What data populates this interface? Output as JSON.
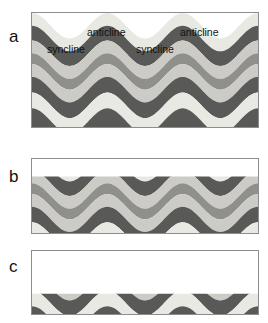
{
  "figure": {
    "caption_present": false,
    "background": "#ffffff",
    "width": 268,
    "height": 323
  },
  "panels": [
    {
      "id": "a",
      "label": "a",
      "label_x": 9,
      "label_y": 28,
      "x": 31,
      "y": 12,
      "w": 228,
      "h": 116,
      "description": "uneroded folded strata",
      "erosion_level": 0
    },
    {
      "id": "b",
      "label": "b",
      "label_x": 9,
      "label_y": 168,
      "x": 31,
      "y": 158,
      "w": 228,
      "h": 76,
      "description": "partially eroded folded strata",
      "erosion_level": 1
    },
    {
      "id": "c",
      "label": "c",
      "label_x": 9,
      "label_y": 258,
      "x": 31,
      "y": 250,
      "w": 228,
      "h": 65,
      "description": "deeply eroded folded strata exposing anticline cores",
      "erosion_level": 2
    }
  ],
  "annotations": [
    {
      "text": "syncline",
      "x": 47,
      "y": 44,
      "panel": "a"
    },
    {
      "text": "anticline",
      "x": 87,
      "y": 27,
      "panel": "a"
    },
    {
      "text": "syncline",
      "x": 136,
      "y": 44,
      "panel": "a"
    },
    {
      "text": "anticline",
      "x": 180,
      "y": 27,
      "panel": "a"
    }
  ],
  "colors": {
    "layer_cream": "#e9e9e4",
    "layer_dark_gray": "#595957",
    "layer_light_gray": "#cccbc6",
    "layer_mid_gray": "#8f8f8b",
    "panel_border": "#8d8d8d",
    "label_text": "#111111",
    "background": "#ffffff"
  },
  "chart_data": {
    "type": "area",
    "title": "",
    "xlabel": "",
    "ylabel": "",
    "fold_geometry": {
      "wavelength": 76,
      "amplitude": 13,
      "phase_offset": 0,
      "cycles_across_panel": 3
    },
    "stratigraphy_top_to_bottom": [
      {
        "name": "unit-1",
        "color": "#e9e9e4",
        "thickness": 13
      },
      {
        "name": "unit-2",
        "color": "#595957",
        "thickness": 15
      },
      {
        "name": "unit-3",
        "color": "#cccbc6",
        "thickness": 13
      },
      {
        "name": "unit-4",
        "color": "#8f8f8b",
        "thickness": 11
      },
      {
        "name": "unit-5",
        "color": "#cccbc6",
        "thickness": 13
      },
      {
        "name": "unit-6",
        "color": "#595957",
        "thickness": 16
      },
      {
        "name": "unit-7",
        "color": "#e9e9e4",
        "thickness": 16
      },
      {
        "name": "unit-8",
        "color": "#595957",
        "thickness": 30
      }
    ],
    "erosion_surfaces": {
      "panel_a": null,
      "panel_b": 18,
      "panel_c": 44
    },
    "annotations": [
      "syncline",
      "anticline",
      "syncline",
      "anticline"
    ]
  }
}
